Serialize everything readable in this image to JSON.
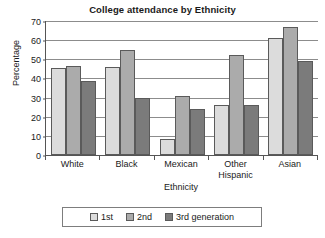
{
  "chart_data": {
    "type": "bar",
    "title": "College attendance by Ethnicity",
    "xlabel": "Ethnicity",
    "ylabel": "Percentage",
    "categories": [
      "White",
      "Black",
      "Mexican",
      "Other Hispanic",
      "Asian"
    ],
    "series": [
      {
        "name": "1st",
        "values": [
          45.5,
          46,
          8.5,
          26,
          61
        ]
      },
      {
        "name": "2nd",
        "values": [
          46.5,
          55,
          31,
          52,
          67
        ]
      },
      {
        "name": "3rd generation",
        "values": [
          38.5,
          30,
          24,
          26,
          49
        ]
      }
    ],
    "ylim": [
      0,
      70
    ],
    "yticks": [
      0,
      10,
      20,
      30,
      40,
      50,
      60,
      70
    ],
    "ytick_labels": [
      "0",
      "10",
      "20",
      "30",
      "40",
      "50",
      "60",
      "70"
    ],
    "grid": true,
    "legend_position": "bottom",
    "colors": {
      "series_1st": "#dcdcdc",
      "series_2nd": "#ababab",
      "series_3rd": "#7b7b7b",
      "bar_outline": "#5a5a5a",
      "gridline": "#8c8c8c",
      "axis": "#555555",
      "background": "#ffffff",
      "text": "#1a1a1a"
    }
  }
}
